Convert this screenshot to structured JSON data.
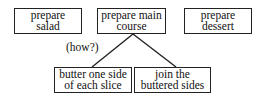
{
  "diagram": {
    "top_nodes": [
      {
        "id": "salad",
        "label": "prepare\nsalad"
      },
      {
        "id": "main",
        "label": "prepare main\ncourse"
      },
      {
        "id": "dessert",
        "label": "prepare\ndessert"
      }
    ],
    "question_label": "(how?)",
    "child_nodes": [
      {
        "id": "butter",
        "label": "butter one side\nof each slice"
      },
      {
        "id": "join",
        "label": "join the\nbuttered sides"
      }
    ],
    "edges": [
      {
        "from": "main",
        "to": "butter"
      },
      {
        "from": "main",
        "to": "join"
      }
    ],
    "colors": {
      "stroke": "#222222",
      "background": "#ffffff",
      "text": "#111111"
    }
  }
}
